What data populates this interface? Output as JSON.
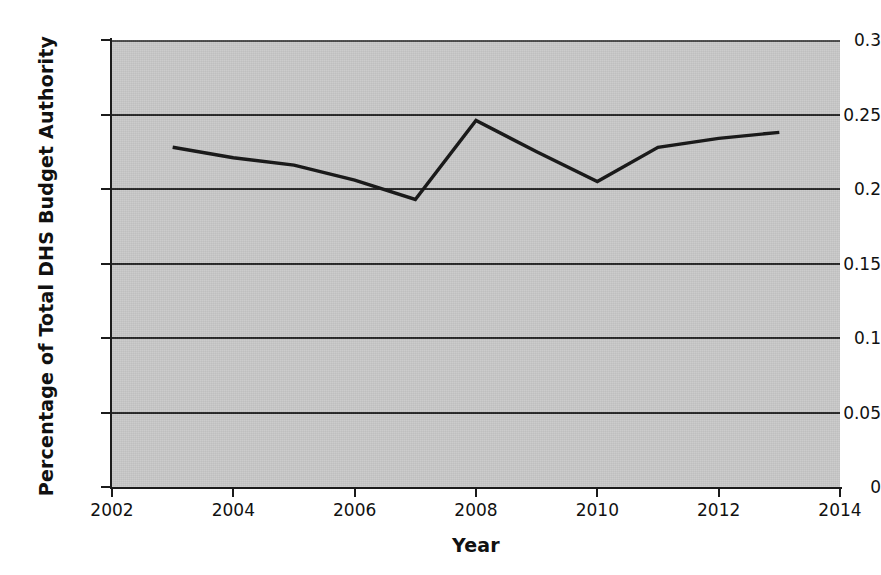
{
  "chart_data": {
    "type": "line",
    "title": "",
    "xlabel": "Year",
    "ylabel": "Percentage of Total DHS Budget Authority",
    "xlim": [
      2002,
      2014
    ],
    "ylim": [
      0,
      0.3
    ],
    "grid": true,
    "legend": "none",
    "x_tick_labels": [
      "2002",
      "2004",
      "2006",
      "2008",
      "2010",
      "2012",
      "2014"
    ],
    "x_ticks": [
      2002,
      2004,
      2006,
      2008,
      2010,
      2012,
      2014
    ],
    "y_tick_labels": [
      "0",
      "0.05",
      "0.1",
      "0.15",
      "0.2",
      "0.25",
      "0.3"
    ],
    "y_ticks": [
      0,
      0.05,
      0.1,
      0.15,
      0.2,
      0.25,
      0.3
    ],
    "x": [
      2003,
      2004,
      2005,
      2006,
      2007,
      2008,
      2009,
      2010,
      2011,
      2012,
      2013
    ],
    "series": [
      {
        "name": "Percentage of Total DHS Budget Authority",
        "values": [
          0.228,
          0.221,
          0.216,
          0.206,
          0.193,
          0.246,
          0.225,
          0.205,
          0.228,
          0.234,
          0.238
        ]
      }
    ],
    "colors": {
      "line": "#1a1a1a",
      "plot_background": "#c9c9c9",
      "gridline": "#262626",
      "axis": "#1b1b1b",
      "text": "#111111",
      "figure_background": "#ffffff"
    }
  }
}
